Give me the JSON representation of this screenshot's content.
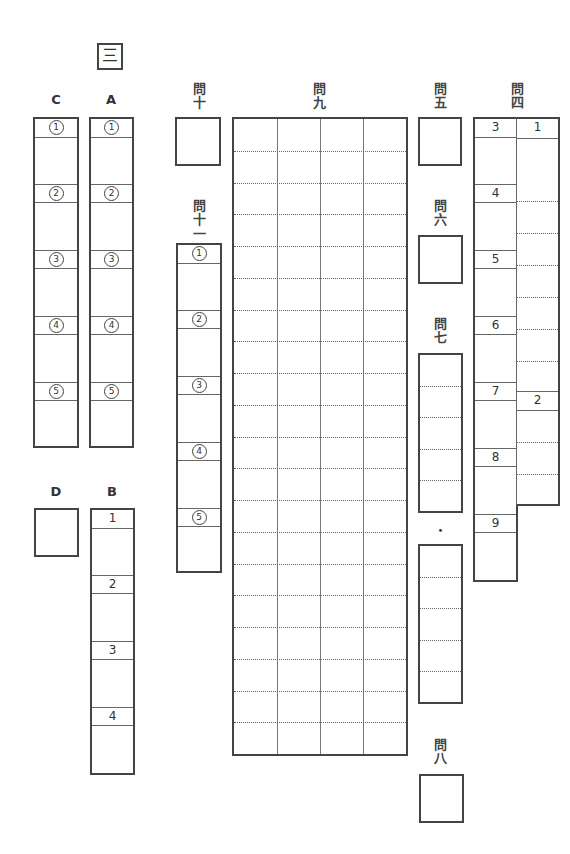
{
  "section_mark": "三",
  "columns": {
    "C": {
      "label": "C",
      "items": [
        "1",
        "2",
        "3",
        "4",
        "5"
      ]
    },
    "A": {
      "label": "A",
      "items": [
        "1",
        "2",
        "3",
        "4",
        "5"
      ]
    },
    "D": {
      "label": "D"
    },
    "B": {
      "label": "B",
      "items": [
        "1",
        "2",
        "3",
        "4"
      ]
    }
  },
  "q10": {
    "label": "問十"
  },
  "q11": {
    "label": "問十一",
    "items": [
      "1",
      "2",
      "3",
      "4",
      "5"
    ]
  },
  "q9": {
    "label": "問九",
    "cols": 4,
    "rows": 20
  },
  "q5": {
    "label": "問五"
  },
  "q6": {
    "label": "問六"
  },
  "q7": {
    "label": "問七",
    "separator": "・",
    "rows": 5
  },
  "q8": {
    "label": "問八"
  },
  "q4": {
    "label": "問四",
    "left_items": [
      "3",
      "4",
      "5",
      "6",
      "7",
      "8",
      "9"
    ],
    "right_items": [
      "1",
      "2"
    ]
  }
}
